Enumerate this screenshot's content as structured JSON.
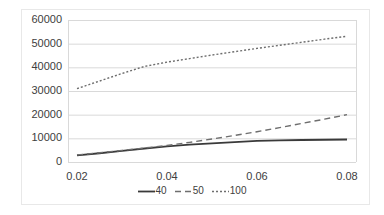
{
  "chart_data": {
    "type": "line",
    "title": "",
    "subtitle": "",
    "xlabel": "",
    "ylabel": "",
    "xlim": [
      0.018,
      0.082
    ],
    "ylim": [
      0,
      60000
    ],
    "grid": true,
    "grid_axis": "y",
    "legend_position": "bottom",
    "y_ticks": [
      0,
      10000,
      20000,
      30000,
      40000,
      50000,
      60000
    ],
    "y_tick_labels": [
      "0",
      "10000",
      "20000",
      "30000",
      "40000",
      "50000",
      "60000"
    ],
    "x_ticks": [
      0.02,
      0.04,
      0.06,
      0.08
    ],
    "x_tick_labels": [
      "0.02",
      "0.04",
      "0.06",
      "0.08"
    ],
    "series": [
      {
        "name": "40",
        "style": "solid",
        "color": "#3a3a3a",
        "x": [
          0.02,
          0.025,
          0.03,
          0.035,
          0.04,
          0.045,
          0.05,
          0.055,
          0.06,
          0.065,
          0.07,
          0.075,
          0.08
        ],
        "values": [
          2800,
          3700,
          4700,
          5700,
          6600,
          7300,
          7900,
          8400,
          8900,
          9150,
          9300,
          9400,
          9500
        ]
      },
      {
        "name": "50",
        "style": "dashed",
        "color": "#6e6e6e",
        "x": [
          0.02,
          0.025,
          0.03,
          0.035,
          0.04,
          0.045,
          0.05,
          0.055,
          0.06,
          0.065,
          0.07,
          0.075,
          0.08
        ],
        "values": [
          3000,
          3900,
          4900,
          5900,
          7000,
          8300,
          9700,
          11200,
          12800,
          14500,
          16300,
          18100,
          20000
        ]
      },
      {
        "name": "100",
        "style": "dotted",
        "color": "#6e6e6e",
        "x": [
          0.02,
          0.025,
          0.03,
          0.035,
          0.04,
          0.045,
          0.05,
          0.055,
          0.06,
          0.065,
          0.07,
          0.075,
          0.08
        ],
        "values": [
          31000,
          34200,
          37400,
          40400,
          42200,
          43700,
          45200,
          46600,
          48000,
          49300,
          50600,
          51900,
          53100
        ]
      }
    ]
  },
  "legend": {
    "items": [
      {
        "label": "40",
        "style": "solid"
      },
      {
        "label": "50",
        "style": "dashed"
      },
      {
        "label": "100",
        "style": "dotted"
      }
    ]
  },
  "colors": {
    "series_40": "#3a3a3a",
    "series_50": "#6e6e6e",
    "series_100": "#6e6e6e",
    "gridline": "#d9d9d9",
    "axis": "#d9d9d9",
    "text": "#404040",
    "frame": "#e8e8e8",
    "background": "#ffffff"
  }
}
